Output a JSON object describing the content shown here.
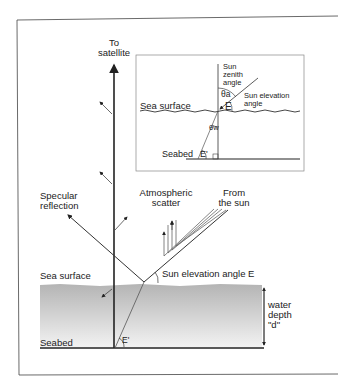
{
  "main": {
    "to_satellite_1": "To",
    "to_satellite_2": "satellite",
    "specular_1": "Specular",
    "specular_2": "reflection",
    "atmos_1": "Atmospheric",
    "atmos_2": "scatter",
    "from_sun_1": "From",
    "from_sun_2": "the sun",
    "sea_surface": "Sea surface",
    "sun_elevation": "Sun elevation angle E",
    "water_1": "water",
    "water_2": "depth",
    "water_3": "\"d\"",
    "seabed": "Seabed",
    "e_prime": "E'"
  },
  "inset": {
    "zenith_1": "Sun",
    "zenith_2": "zenith",
    "zenith_3": "angle",
    "theta_a": "θa",
    "e_label": "E",
    "elev_1": "Sun elevation",
    "elev_2": "angle",
    "sea_surface": "Sea surface",
    "theta_w": "θw",
    "seabed": "Seabed",
    "e_prime": "E'"
  },
  "colors": {
    "water_top": "#b4b4b4",
    "water_bottom": "#f0f0f0",
    "line": "#222222"
  }
}
